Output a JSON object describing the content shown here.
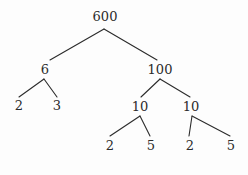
{
  "diagram": {
    "type": "factor-tree",
    "background_color": "#fdfdfd",
    "stroke_color": "#2b2b2b",
    "text_color": "#2b2b2b",
    "nodes": [
      {
        "id": "root",
        "label": "600",
        "x": 105,
        "y": 16,
        "branch_x": 104,
        "branch_y": 29
      },
      {
        "id": "n6",
        "label": "6",
        "x": 45,
        "y": 69,
        "branch_x": 44,
        "branch_y": 79
      },
      {
        "id": "n100",
        "label": "100",
        "x": 160,
        "y": 69,
        "branch_x": 160,
        "branch_y": 79
      },
      {
        "id": "n2a",
        "label": "2",
        "x": 19,
        "y": 105,
        "branch_x": 19,
        "branch_y": 98
      },
      {
        "id": "n3a",
        "label": "3",
        "x": 57,
        "y": 105,
        "branch_x": 57,
        "branch_y": 98
      },
      {
        "id": "n10a",
        "label": "10",
        "x": 140,
        "y": 106,
        "branch_x": 140,
        "branch_y": 116
      },
      {
        "id": "n10b",
        "label": "10",
        "x": 191,
        "y": 106,
        "branch_x": 192,
        "branch_y": 116
      },
      {
        "id": "n2b",
        "label": "2",
        "x": 110,
        "y": 145,
        "branch_x": 110,
        "branch_y": 137
      },
      {
        "id": "n5a",
        "label": "5",
        "x": 151,
        "y": 145,
        "branch_x": 151,
        "branch_y": 137
      },
      {
        "id": "n2c",
        "label": "2",
        "x": 190,
        "y": 145,
        "branch_x": 190,
        "branch_y": 137
      },
      {
        "id": "n5b",
        "label": "5",
        "x": 231,
        "y": 145,
        "branch_x": 231,
        "branch_y": 137
      }
    ],
    "edges": [
      {
        "id": "e-root-6",
        "from": "root",
        "to": "n6",
        "x1": 104,
        "y1": 29,
        "x2": 50,
        "y2": 60
      },
      {
        "id": "e-root-100",
        "from": "root",
        "to": "n100",
        "x1": 104,
        "y1": 29,
        "x2": 157,
        "y2": 60
      },
      {
        "id": "e-6-2",
        "from": "n6",
        "to": "n2a",
        "x1": 44,
        "y1": 79,
        "x2": 19,
        "y2": 97
      },
      {
        "id": "e-6-3",
        "from": "n6",
        "to": "n3a",
        "x1": 44,
        "y1": 79,
        "x2": 57,
        "y2": 97
      },
      {
        "id": "e-100-10a",
        "from": "n100",
        "to": "n10a",
        "x1": 160,
        "y1": 79,
        "x2": 141,
        "y2": 97
      },
      {
        "id": "e-100-10b",
        "from": "n100",
        "to": "n10b",
        "x1": 160,
        "y1": 79,
        "x2": 190,
        "y2": 97
      },
      {
        "id": "e-10a-2",
        "from": "n10a",
        "to": "n2b",
        "x1": 140,
        "y1": 116,
        "x2": 110,
        "y2": 136
      },
      {
        "id": "e-10a-5",
        "from": "n10a",
        "to": "n5a",
        "x1": 140,
        "y1": 116,
        "x2": 150,
        "y2": 136
      },
      {
        "id": "e-10b-2",
        "from": "n10b",
        "to": "n2c",
        "x1": 192,
        "y1": 116,
        "x2": 189,
        "y2": 136
      },
      {
        "id": "e-10b-5",
        "from": "n10b",
        "to": "n5b",
        "x1": 192,
        "y1": 116,
        "x2": 230,
        "y2": 136
      }
    ]
  }
}
